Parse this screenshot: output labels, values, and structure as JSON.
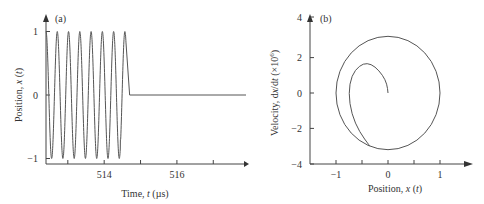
{
  "chart_data": [
    {
      "id": "a",
      "type": "line",
      "panel_label": "(a)",
      "title": "",
      "xlabel_parts": [
        "Time, ",
        "t",
        " (µs)"
      ],
      "xlabel": "Time, t (µs)",
      "ylabel_parts": [
        "Position, ",
        "x",
        " (",
        "t",
        ")"
      ],
      "ylabel": "Position, x (t)",
      "xlim": [
        512.4,
        517.9
      ],
      "ylim": [
        -1.1,
        1.15
      ],
      "xticks": [
        513,
        514,
        515,
        516,
        517
      ],
      "xtick_labels": [
        {
          "value": 514,
          "label": "514"
        },
        {
          "value": 516,
          "label": "516"
        }
      ],
      "yticks": [
        {
          "value": 1,
          "label": "1"
        },
        {
          "value": 0,
          "label": "0"
        },
        {
          "value": -1,
          "label": "−1"
        }
      ],
      "grid": false,
      "legend": null,
      "description": "Sinusoidal oscillation between -1 and +1 with ~7 cycles (period ~0.31 µs) from t≈512.4 to t≈514.6, ending with a partial negative swing to about -0.7, then the position abruptly returns to 0 near t≈514.7 and stays flat at 0 until t≈517.9.",
      "series": [
        {
          "name": "x(t)",
          "oscillation": {
            "t_start": 512.4,
            "t_end": 514.6,
            "amplitude": 1,
            "period": 0.31,
            "final_min": -0.7
          },
          "flat": {
            "t_start": 514.7,
            "t_end": 517.9,
            "value": 0
          }
        }
      ]
    },
    {
      "id": "b",
      "type": "line",
      "panel_label": "(b)",
      "title": "",
      "xlabel_parts": [
        "Position, ",
        "x",
        " (",
        "t",
        ")"
      ],
      "xlabel": "Position, x (t)",
      "ylabel_parts": [
        "Velocity, d",
        "x",
        "/d",
        "t",
        " (×10",
        "6",
        ")"
      ],
      "ylabel": "Velocity, dx/dt (×10^6)",
      "xlim": [
        -1.5,
        1.5
      ],
      "ylim": [
        -4,
        4
      ],
      "xticks": [
        -1,
        -0.5,
        0,
        0.5,
        1
      ],
      "xtick_labels": [
        {
          "value": -1,
          "label": "−1"
        },
        {
          "value": 0,
          "label": "0"
        },
        {
          "value": 1,
          "label": "1"
        }
      ],
      "yticks": [
        {
          "value": 4,
          "label": "4"
        },
        {
          "value": 2,
          "label": "2"
        },
        {
          "value": 0,
          "label": "0"
        },
        {
          "value": -2,
          "label": "−2"
        },
        {
          "value": -4,
          "label": "−4"
        }
      ],
      "grid": false,
      "legend": null,
      "description": "Phase portrait: a near-circular orbit of x-radius 1 and velocity-radius ~3.2 centered at origin, plus a spiral-like transient branch leaving the orbit near (-0.35, -3.0), sweeping up through (-0.75, 0) to a peak near (-0.4, 1.7) and ending at the origin (0, 0).",
      "series": [
        {
          "name": "limit cycle",
          "center": [
            0,
            0
          ],
          "x_radius": 1.0,
          "v_radius": 3.2
        },
        {
          "name": "transient",
          "points": [
            [
              -0.35,
              -3.0
            ],
            [
              -0.55,
              -2.2
            ],
            [
              -0.7,
              -1.2
            ],
            [
              -0.76,
              0.0
            ],
            [
              -0.7,
              1.0
            ],
            [
              -0.55,
              1.55
            ],
            [
              -0.4,
              1.7
            ],
            [
              -0.25,
              1.5
            ],
            [
              -0.1,
              1.0
            ],
            [
              -0.02,
              0.5
            ],
            [
              0.0,
              0.0
            ]
          ]
        }
      ]
    }
  ]
}
